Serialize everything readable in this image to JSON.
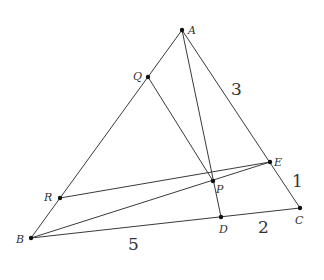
{
  "diagram": {
    "type": "geometry-triangle",
    "stroke_color": "#3a3a3a",
    "point_color": "#111111",
    "points": {
      "A": {
        "label": "A",
        "x": 182,
        "y": 30
      },
      "B": {
        "label": "B",
        "x": 31,
        "y": 238
      },
      "C": {
        "label": "C",
        "x": 300,
        "y": 208
      },
      "D": {
        "label": "D",
        "x": 221,
        "y": 217
      },
      "E": {
        "label": "E",
        "x": 270,
        "y": 162
      },
      "P": {
        "label": "P",
        "x": 213,
        "y": 181
      },
      "Q": {
        "label": "Q",
        "x": 148,
        "y": 77
      },
      "R": {
        "label": "R",
        "x": 60,
        "y": 198
      }
    },
    "segments": [
      [
        "A",
        "B"
      ],
      [
        "A",
        "C"
      ],
      [
        "B",
        "C"
      ],
      [
        "A",
        "D"
      ],
      [
        "B",
        "E"
      ],
      [
        "Q",
        "P"
      ],
      [
        "R",
        "E"
      ]
    ],
    "lengths": [
      {
        "segment": "AE",
        "value": "3"
      },
      {
        "segment": "EC",
        "value": "1"
      },
      {
        "segment": "DC",
        "value": "2"
      },
      {
        "segment": "BD",
        "value": "5"
      }
    ]
  }
}
